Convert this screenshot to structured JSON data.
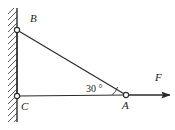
{
  "figure": {
    "colors": {
      "stroke": "#2b2b2b",
      "wall": "#3a3a3a",
      "hatch": "#4a4a4a",
      "text": "#1a1a1a",
      "background": "#ffffff",
      "node_fill": "#ffffff"
    },
    "labels": {
      "point_b": "B",
      "point_c": "C",
      "point_a": "A",
      "force": "F",
      "angle": "30 °"
    },
    "geometry": {
      "wall_x": 17,
      "wall_top_y": 8,
      "wall_bottom_y": 122,
      "point_b": {
        "x": 17,
        "y": 30
      },
      "point_c": {
        "x": 17,
        "y": 96
      },
      "point_a": {
        "x": 126,
        "y": 95
      },
      "arrow_start": {
        "x": 126,
        "y": 95
      },
      "arrow_end": {
        "x": 170,
        "y": 95
      },
      "node_radius": 2.6,
      "angle_value_deg": 30
    }
  }
}
